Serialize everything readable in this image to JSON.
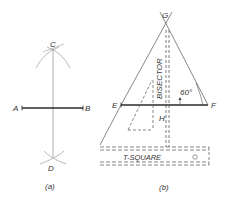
{
  "figure_a": {
    "caption": "(a)",
    "points": {
      "A": "A",
      "B": "B",
      "C": "C",
      "D": "D"
    }
  },
  "figure_b": {
    "caption": "(b)",
    "points": {
      "E": "E",
      "F": "F",
      "G": "G",
      "H": "H"
    },
    "bisector_label": "BISECTOR",
    "angle_label": "60°",
    "tsquare_label": "T-SQUARE"
  },
  "colors": {
    "line_dark": "#2a2a2a",
    "line_light": "#8a8a8a",
    "text": "#333333"
  }
}
